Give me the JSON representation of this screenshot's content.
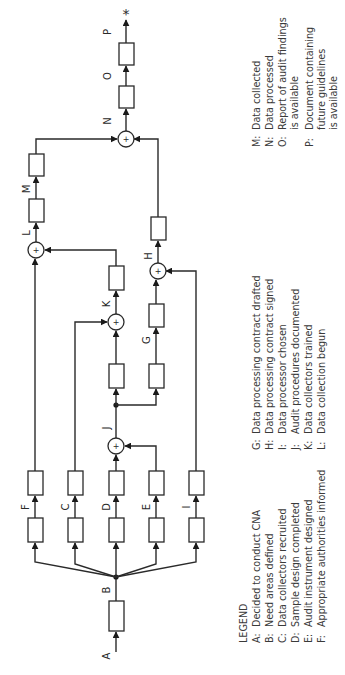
{
  "diagram": {
    "type": "activity-network",
    "orientation": "rotated-90-ccw",
    "nodes": {
      "A": "A",
      "B": "B",
      "C": "C",
      "D": "D",
      "E": "E",
      "F": "F",
      "G": "G",
      "H": "H",
      "I": "I",
      "J": "J",
      "K": "K",
      "L": "L",
      "M": "M",
      "N": "N",
      "O": "O",
      "P": "P"
    },
    "sum_symbol": "+",
    "terminal_symbol": "*"
  },
  "legend": {
    "title": "LEGEND",
    "col1": [
      {
        "key": "A:",
        "text": "Decided to conduct CNA"
      },
      {
        "key": "B:",
        "text": "Need areas defined"
      },
      {
        "key": "C:",
        "text": "Data collectors recruited"
      },
      {
        "key": "D:",
        "text": "Sample design completed"
      },
      {
        "key": "E:",
        "text": "Audit instrument designed"
      },
      {
        "key": "F:",
        "text": "Appropriate authorities informed"
      }
    ],
    "col2": [
      {
        "key": "G:",
        "text": "Data processing contract drafted"
      },
      {
        "key": "H:",
        "text": "Data processing contract signed"
      },
      {
        "key": "I:",
        "text": "Data processor chosen"
      },
      {
        "key": "J:",
        "text": "Audit procedures documented"
      },
      {
        "key": "K:",
        "text": "Data collectors trained"
      },
      {
        "key": "L:",
        "text": "Data collection begun"
      }
    ],
    "col3": [
      {
        "key": "M:",
        "lines": [
          "Data collected"
        ]
      },
      {
        "key": "N:",
        "lines": [
          "Data processed"
        ]
      },
      {
        "key": "O:",
        "lines": [
          "Report of audit findings",
          "is available"
        ]
      },
      {
        "key": "P:",
        "lines": [
          "Document containing",
          "future guidelines",
          "is available"
        ]
      }
    ]
  }
}
